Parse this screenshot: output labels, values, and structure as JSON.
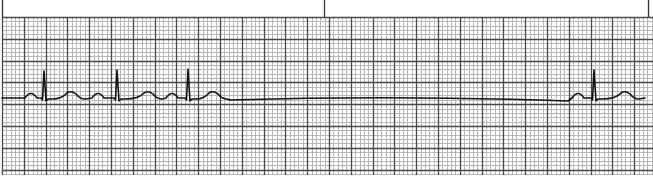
{
  "strip": {
    "title": "ECG rhythm strip",
    "width": 653,
    "height": 178,
    "grid": {
      "top": 17,
      "bottom": 175,
      "left": 2,
      "right": 653,
      "minor_spacing": 4.36,
      "major_every": 5,
      "minor_color": "#b8b8b8",
      "major_color": "#4a4a4a",
      "background": "#ffffff"
    },
    "markers": [
      {
        "x": 2,
        "y1": 0,
        "y2": 17
      },
      {
        "x": 324,
        "y1": 0,
        "y2": 17
      },
      {
        "x": 648,
        "y1": 0,
        "y2": 17
      }
    ],
    "trace": {
      "color": "#111111",
      "width": 1.6,
      "baseline_y": 98,
      "beats": [
        {
          "label": "beat-1",
          "p_x": 31,
          "qrs_x": 44,
          "qrs_peak_y": 71,
          "t_x": 71
        },
        {
          "label": "beat-2",
          "p_x": 98,
          "qrs_x": 117,
          "qrs_peak_y": 70,
          "t_x": 148
        },
        {
          "label": "beat-3",
          "p_x": 172,
          "qrs_x": 188,
          "qrs_peak_y": 69,
          "t_x": 213
        },
        {
          "label": "beat-4",
          "p_x": 578,
          "qrs_x": 594,
          "qrs_peak_y": 70,
          "t_x": 625
        }
      ],
      "pause": {
        "start_x": 230,
        "end_x": 568,
        "start_y": 100,
        "mid_y": 95,
        "end_y": 101
      },
      "end_x": 645
    }
  }
}
